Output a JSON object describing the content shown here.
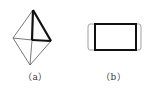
{
  "figures": [
    {
      "id": "a",
      "label": "（a）",
      "description": "octahedron-like wireframe with bold tetrahedral face",
      "colors": {
        "thin": "#555555",
        "bold": "#111111"
      }
    },
    {
      "id": "b",
      "label": "（b）",
      "description": "bold rectangle with thin rounded caps on left and right",
      "colors": {
        "thin": "#888888",
        "bold": "#111111"
      }
    }
  ]
}
